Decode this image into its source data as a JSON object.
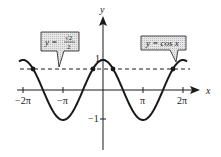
{
  "chart_data": {
    "type": "line",
    "title": "",
    "xlabel": "x",
    "ylabel": "y",
    "xlim": [
      -6.6,
      6.9
    ],
    "ylim": [
      -1.5,
      1.6
    ],
    "grid": false,
    "legend": "callout boxes",
    "x_ticks": [
      {
        "value": -6.2832,
        "label": "−2π"
      },
      {
        "value": -3.1416,
        "label": "−π"
      },
      {
        "value": 3.1416,
        "label": "π"
      },
      {
        "value": 6.2832,
        "label": "2π"
      }
    ],
    "y_ticks": [
      {
        "value": 1,
        "label": "1"
      },
      {
        "value": -1,
        "label": "−1"
      }
    ],
    "series": [
      {
        "name": "y = cos x",
        "style": "solid",
        "function": "cos(x)",
        "domain": [
          -6.6,
          6.6
        ],
        "x": [
          -6.2832,
          -4.7124,
          -3.1416,
          -1.5708,
          0,
          1.5708,
          3.1416,
          4.7124,
          6.2832
        ],
        "values": [
          1,
          0,
          -1,
          0,
          1,
          0,
          -1,
          0,
          1
        ]
      },
      {
        "name": "y = √2/2",
        "style": "dashed",
        "function": "0.7071",
        "domain": [
          -6.6,
          6.6
        ],
        "x": [
          -6.6,
          6.6
        ],
        "values": [
          0.7071,
          0.7071
        ]
      }
    ],
    "intersection_points": [
      {
        "x": -5.4978,
        "y": 0.7071,
        "label": "-7π/4"
      },
      {
        "x": -0.7854,
        "y": 0.7071,
        "label": "-π/4"
      },
      {
        "x": 0.7854,
        "y": 0.7071,
        "label": "π/4"
      },
      {
        "x": 5.4978,
        "y": 0.7071,
        "label": "7π/4"
      }
    ],
    "annotations": [
      {
        "text": "y = √2/2",
        "points_to": "dashed line"
      },
      {
        "text": "y = cos x",
        "points_to": "cosine curve"
      }
    ]
  },
  "labels": {
    "x_axis": "x",
    "y_axis": "y",
    "tick_neg2pi": "−2π",
    "tick_negpi": "−π",
    "tick_pi": "π",
    "tick_2pi": "2π",
    "tick_y1": "1",
    "tick_yneg1": "−1",
    "callout_left_prefix": "y =",
    "callout_left_num": "√2",
    "callout_left_den": "2",
    "callout_right": "y = cos x"
  },
  "colors": {
    "ink": "#1a1a1a",
    "callout_fill": "#d9d9d9"
  }
}
